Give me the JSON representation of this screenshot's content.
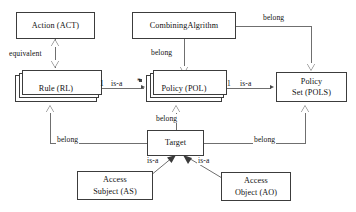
{
  "diagram": {
    "line_color": "#6f6f6f",
    "border_color": "#3c3c3c",
    "text_color": "#111111",
    "background": "#ffffff"
  },
  "nodes": {
    "action": {
      "label": "Action (ACT)",
      "kind": "class"
    },
    "combining_algrithm": {
      "label": "CombiningAlgrithm",
      "kind": "class"
    },
    "rule": {
      "label": "Rule (RL)",
      "kind": "multi-instance-class"
    },
    "policy": {
      "label": "Policy (POL)",
      "kind": "multi-instance-class"
    },
    "policy_set_line1": {
      "label": "Policy"
    },
    "policy_set_line2": {
      "label": "Set (POLS)"
    },
    "target": {
      "label": "Target",
      "kind": "class"
    },
    "access_subject_line1": {
      "label": "Access"
    },
    "access_subject_line2": {
      "label": "Subject (AS)"
    },
    "access_object_line1": {
      "label": "Access"
    },
    "access_object_line2": {
      "label": "Object (AO)"
    }
  },
  "edges": {
    "act_rule": {
      "label": "equivalent",
      "from": "rule",
      "to": "action",
      "type": "generalization"
    },
    "calg_policy": {
      "label": "belong",
      "from": "combining_algrithm",
      "to": "policy",
      "type": "generalization"
    },
    "calg_policyset": {
      "label": "belong",
      "from": "combining_algrithm",
      "to": "policy_set",
      "type": "generalization"
    },
    "rule_policy": {
      "label": "is-a",
      "from": "rule",
      "to": "policy",
      "type": "association"
    },
    "policy_policyset": {
      "label": "is-a",
      "from": "policy",
      "to": "policy_set",
      "type": "association"
    },
    "target_rule": {
      "label": "belong",
      "from": "target",
      "to": "rule",
      "type": "generalization"
    },
    "target_policy": {
      "label": "belong",
      "from": "target",
      "to": "policy",
      "type": "generalization"
    },
    "target_policyset": {
      "label": "belong",
      "from": "target",
      "to": "policy_set",
      "type": "generalization"
    },
    "as_target": {
      "label": "is-a",
      "from": "access_subject",
      "to": "target",
      "type": "generalization"
    },
    "ao_target": {
      "label": "is-a",
      "from": "access_object",
      "to": "target",
      "type": "generalization"
    }
  },
  "multiplicities": {
    "rule_policy_source": "1",
    "rule_policy_target": "*",
    "policy_policyset_source": "1"
  }
}
